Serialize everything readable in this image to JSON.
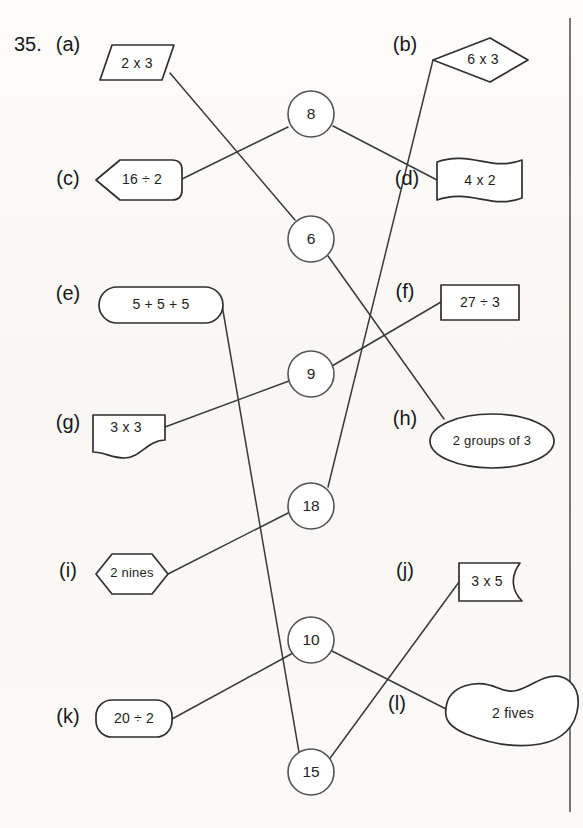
{
  "page": {
    "question_number": "35.",
    "width": 583,
    "height": 828,
    "background_color": "#fbfaf8",
    "ink_color": "#2f2f31",
    "line_color": "#3a3a3c"
  },
  "items": [
    {
      "key": "a",
      "label": "(a)",
      "text": "2 x 3",
      "shape": "parallelogram",
      "side": "left"
    },
    {
      "key": "b",
      "label": "(b)",
      "text": "6 x 3",
      "shape": "diamond",
      "side": "right"
    },
    {
      "key": "c",
      "label": "(c)",
      "text": "16 ÷ 2",
      "shape": "left-arrow-pentagon",
      "side": "left"
    },
    {
      "key": "d",
      "label": "(d)",
      "text": "4 x 2",
      "shape": "banner-flag",
      "side": "right"
    },
    {
      "key": "e",
      "label": "(e)",
      "text": "5 + 5 + 5",
      "shape": "stadium-pill",
      "side": "left"
    },
    {
      "key": "f",
      "label": "(f)",
      "text": "27 ÷ 3",
      "shape": "rectangle",
      "side": "right"
    },
    {
      "key": "g",
      "label": "(g)",
      "text": "3 x 3",
      "shape": "torn-corner-document",
      "side": "left"
    },
    {
      "key": "h",
      "label": "(h)",
      "text": "2 groups of 3",
      "shape": "ellipse",
      "side": "right"
    },
    {
      "key": "i",
      "label": "(i)",
      "text": "2 nines",
      "shape": "hexagon",
      "side": "left"
    },
    {
      "key": "j",
      "label": "(j)",
      "text": "3 x 5",
      "shape": "wavy-right-edge-rectangle",
      "side": "right"
    },
    {
      "key": "k",
      "label": "(k)",
      "text": "20 ÷ 2",
      "shape": "rounded-rectangle",
      "side": "left"
    },
    {
      "key": "l",
      "label": "(l)",
      "text": "2 fives",
      "shape": "blob",
      "side": "right"
    }
  ],
  "nodes": [
    {
      "id": "n8",
      "value": "8"
    },
    {
      "id": "n6",
      "value": "6"
    },
    {
      "id": "n9",
      "value": "9"
    },
    {
      "id": "n18",
      "value": "18"
    },
    {
      "id": "n10",
      "value": "10"
    },
    {
      "id": "n15",
      "value": "15"
    }
  ],
  "connections": [
    {
      "from": "a",
      "to": "n6"
    },
    {
      "from": "c",
      "to": "n8"
    },
    {
      "from": "n8",
      "to": "d"
    },
    {
      "from": "b",
      "to": "n18"
    },
    {
      "from": "n6",
      "to": "h"
    },
    {
      "from": "g",
      "to": "n9"
    },
    {
      "from": "n9",
      "to": "f"
    },
    {
      "from": "i",
      "to": "n18"
    },
    {
      "from": "e",
      "to": "n15"
    },
    {
      "from": "k",
      "to": "n10"
    },
    {
      "from": "n10",
      "to": "l"
    },
    {
      "from": "n15",
      "to": "j"
    }
  ]
}
